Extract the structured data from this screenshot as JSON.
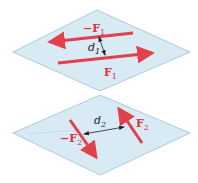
{
  "diagram": {
    "colors": {
      "plane_fill": "#d8eaf3",
      "plane_stroke": "#a9cde0",
      "force": "#e2404a",
      "label_force": "#d9303a",
      "dimension": "#222222"
    },
    "top_plane": {
      "force_neg_label": "−F",
      "force_neg_sub": "1",
      "force_pos_label": "F",
      "force_pos_sub": "1",
      "distance_label": "d",
      "distance_sub": "1"
    },
    "bottom_plane": {
      "force_neg_label": "−F",
      "force_neg_sub": "2",
      "force_pos_label": "F",
      "force_pos_sub": "2",
      "distance_label": "d",
      "distance_sub": "2"
    }
  }
}
